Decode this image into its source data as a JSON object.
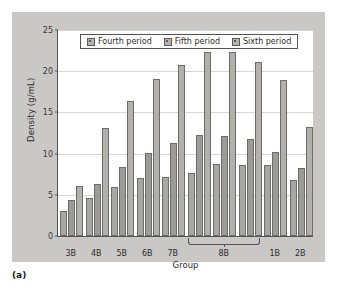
{
  "caption": "(a)",
  "chart_data": {
    "type": "bar",
    "title": "",
    "xlabel": "Group",
    "ylabel": "Density (g/mL)",
    "ylim": [
      0,
      25
    ],
    "yticks": [
      0,
      5,
      10,
      15,
      20,
      25
    ],
    "grid": true,
    "legend_position": "top-center",
    "categories": [
      "3B",
      "4B",
      "5B",
      "6B",
      "7B",
      "8B",
      "8B",
      "8B",
      "1B",
      "2B"
    ],
    "category_labels": [
      "3B",
      "4B",
      "5B",
      "6B",
      "7B",
      "8B",
      "1B",
      "2B"
    ],
    "grouped_label": {
      "label": "8B",
      "spans_categories": 3,
      "start_index": 5
    },
    "series": [
      {
        "name": "Fourth period",
        "values": [
          3.0,
          4.6,
          6.0,
          7.0,
          7.2,
          7.6,
          8.7,
          8.6,
          8.6,
          6.8
        ]
      },
      {
        "name": "Fifth period",
        "values": [
          4.4,
          6.3,
          8.4,
          10.1,
          11.3,
          12.2,
          12.1,
          11.8,
          10.2,
          8.3
        ]
      },
      {
        "name": "Sixth period",
        "values": [
          6.1,
          13.1,
          16.4,
          19.1,
          20.7,
          22.3,
          22.3,
          21.1,
          18.9,
          13.2
        ]
      }
    ],
    "colors": {
      "series_fill": [
        "#a9a7a4",
        "#9d9b98",
        "#b2b0ad"
      ],
      "bar_border": "#6e6c68",
      "plot_background": "#ffffff",
      "figure_background": "#c9c8c6",
      "axis": "#55534f",
      "gridline": "#d9d7d3"
    }
  }
}
